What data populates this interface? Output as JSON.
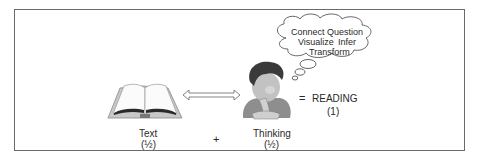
{
  "diagram": {
    "thought_bubble": {
      "words_line1": [
        "Connect",
        "Question"
      ],
      "words_line2": [
        "Visualize",
        "Infer"
      ],
      "words_line3": [
        "Transform"
      ]
    },
    "text_label": "Text",
    "text_fraction": "(½)",
    "plus": "+",
    "thinking_label": "Thinking",
    "thinking_fraction": "(½)",
    "equals": "=",
    "result_label": "READING",
    "result_value": "(1)",
    "icons": [
      "open-book-icon",
      "double-arrow-icon",
      "thinking-person-icon",
      "thought-bubble-icon"
    ]
  }
}
